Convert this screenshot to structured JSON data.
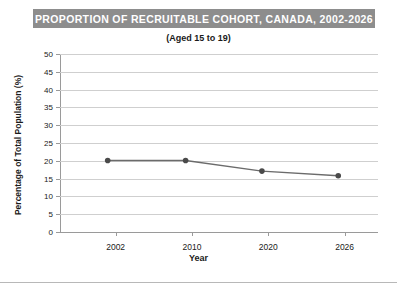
{
  "figure": {
    "title": "PROPORTION OF RECRUITABLE COHORT, CANADA, 2002-2026",
    "subtitle": "(Aged 15 to 19)",
    "title_banner_color": "#8d8d8d",
    "title_text_color": "#ffffff",
    "background_color": "#ffffff"
  },
  "chart_data": {
    "type": "line",
    "title": "PROPORTION OF RECRUITABLE COHORT, CANADA, 2002-2026",
    "subtitle": "(Aged 15 to 19)",
    "xlabel": "Year",
    "ylabel": "Percentage of Total Population (%)",
    "x": [
      2002,
      2010,
      2020,
      2026
    ],
    "xtick_labels": [
      "2002",
      "2010",
      "2020",
      "2026"
    ],
    "values": [
      20.1,
      20.1,
      17.1,
      15.8
    ],
    "ylim": [
      0,
      50
    ],
    "ytick_labels": [
      "0",
      "5",
      "10",
      "15",
      "20",
      "25",
      "30",
      "35",
      "40",
      "45",
      "50"
    ],
    "yticks": [
      0,
      5,
      10,
      15,
      20,
      25,
      30,
      35,
      40,
      45,
      50
    ],
    "grid": "horizontal",
    "legend": "none",
    "line_color": "#6b6b6b",
    "marker_color": "#4a4a4a",
    "gridline_color": "#cfcfcf",
    "axis_color": "#9a9a9a"
  }
}
